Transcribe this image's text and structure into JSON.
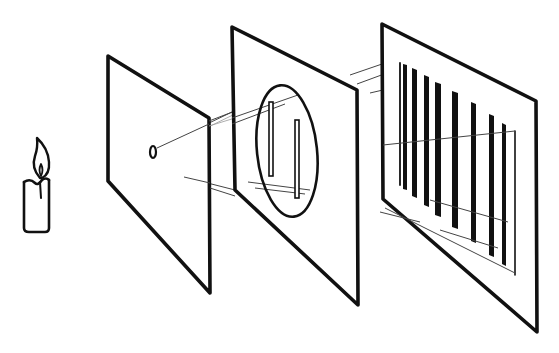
{
  "diagram": {
    "colors": {
      "ink": "#111111",
      "ray": "#444444",
      "background": "#ffffff"
    },
    "elements": [
      {
        "id": "candle",
        "label": "Candle (light source)",
        "icon": "candle-icon"
      },
      {
        "id": "single-slit-screen",
        "label": "Screen with single pinhole"
      },
      {
        "id": "double-slit-screen",
        "label": "Screen with two slits (circled)"
      },
      {
        "id": "detection-screen",
        "label": "Screen showing interference fringes"
      }
    ],
    "fringe_count": 10,
    "slit_count": 2
  }
}
